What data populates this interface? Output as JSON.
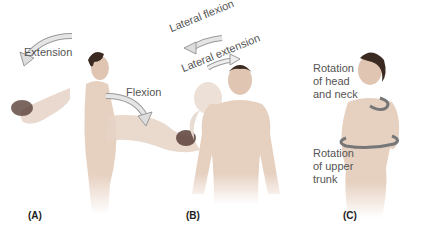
{
  "figure": {
    "panels": [
      {
        "id": "A",
        "label": "(A)",
        "motions": [
          "Extension",
          "Flexion"
        ]
      },
      {
        "id": "B",
        "label": "(B)",
        "motions": [
          "Lateral flexion",
          "Lateral extension"
        ]
      },
      {
        "id": "C",
        "label": "(C)",
        "motions": [
          "Rotation of head and neck",
          "Rotation of upper trunk"
        ]
      }
    ],
    "labels": {
      "extension": "Extension",
      "flexion": "Flexion",
      "lateral_flexion": "Lateral flexion",
      "lateral_extension": "Lateral extension",
      "rotation_head_1": "Rotation",
      "rotation_head_2": "of head",
      "rotation_head_3": "and neck",
      "rotation_trunk_1": "Rotation",
      "rotation_trunk_2": "of upper",
      "rotation_trunk_3": "trunk"
    },
    "colors": {
      "skin": "#e9d3c3",
      "skin_shade": "#c9a894",
      "hair": "#3a2a22",
      "arrow": "#d8d8d8",
      "arrow_stroke": "#9a9a9a",
      "text": "#555555"
    }
  }
}
